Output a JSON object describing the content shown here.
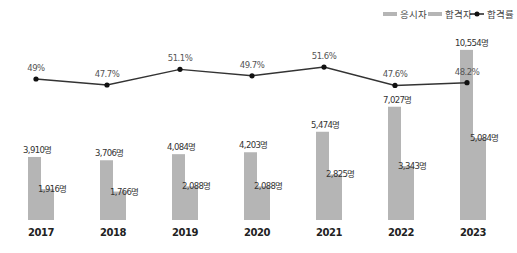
{
  "legend": {
    "applicants_label": "응시자",
    "passers_label": "합격자",
    "rate_label": "합격률"
  },
  "colors": {
    "applicants": "#b5b5b5",
    "passers": "#b5b5b5",
    "line": "#333333",
    "marker": "#111111"
  },
  "chart_data": {
    "type": "bar",
    "title": "",
    "xlabel": "",
    "ylabel": "",
    "categories": [
      "2017",
      "2018",
      "2019",
      "2020",
      "2021",
      "2022",
      "2023"
    ],
    "series": [
      {
        "name": "응시자",
        "type": "bar",
        "values": [
          3910,
          3706,
          4084,
          4203,
          5474,
          7027,
          10554
        ],
        "labels": [
          "3,910명",
          "3,706명",
          "4,084명",
          "4,203명",
          "5,474명",
          "7,027명",
          "10,554명"
        ]
      },
      {
        "name": "합격자",
        "type": "bar",
        "values": [
          1916,
          1766,
          2088,
          2088,
          2825,
          3343,
          5084
        ],
        "labels": [
          "1,916명",
          "1,766명",
          "2,088명",
          "2,088명",
          "2,825명",
          "3,343명",
          "5,084명"
        ]
      },
      {
        "name": "합격률",
        "type": "line",
        "values": [
          49,
          47.7,
          51.1,
          49.7,
          51.6,
          47.6,
          48.2
        ],
        "labels": [
          "49%",
          "47.7%",
          "51.1%",
          "49.7%",
          "51.6%",
          "47.6%",
          "48.2%"
        ]
      }
    ],
    "grid": false,
    "legend_position": "top-right"
  }
}
